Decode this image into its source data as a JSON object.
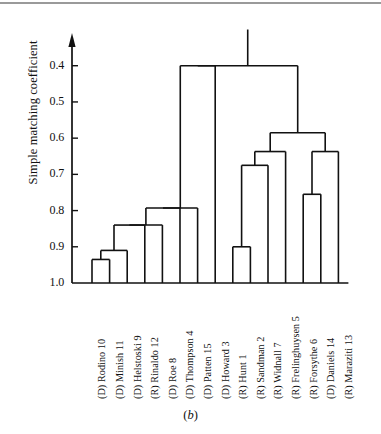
{
  "figure": {
    "caption_open": "(",
    "caption_letter": "b",
    "caption_close": ")",
    "axis_label": "Simple matching coefficient",
    "line_color": "#111111",
    "rule_color": "#9a9a9a"
  },
  "chart_data": {
    "type": "dendrogram",
    "title": "",
    "xlabel": "",
    "ylabel": "Simple matching coefficient",
    "ylim": [
      1.0,
      0.34
    ],
    "y_axis_inverted": true,
    "grid": false,
    "legend": null,
    "tick_labels": [
      "0.4",
      "0.5",
      "0.6",
      "0.7",
      "0.8",
      "0.9",
      "1.0"
    ],
    "tick_values": [
      0.4,
      0.5,
      0.6,
      0.7,
      0.8,
      0.9,
      1.0
    ],
    "leaves": [
      {
        "index": 0,
        "label": "(D) Rodino 10",
        "party": "D",
        "name": "Rodino",
        "number": 10
      },
      {
        "index": 1,
        "label": "(D) Minish 11",
        "party": "D",
        "name": "Minish",
        "number": 11
      },
      {
        "index": 2,
        "label": "(D) Helstoski 9",
        "party": "D",
        "name": "Helstoski",
        "number": 9
      },
      {
        "index": 3,
        "label": "(R) Rinaldo 12",
        "party": "R",
        "name": "Rinaldo",
        "number": 12
      },
      {
        "index": 4,
        "label": "(D) Roe 8",
        "party": "D",
        "name": "Roe",
        "number": 8
      },
      {
        "index": 5,
        "label": "(D) Thompson 4",
        "party": "D",
        "name": "Thompson",
        "number": 4
      },
      {
        "index": 6,
        "label": "(D) Patten 15",
        "party": "D",
        "name": "Patten",
        "number": 15
      },
      {
        "index": 7,
        "label": "(D) Howard 3",
        "party": "D",
        "name": "Howard",
        "number": 3
      },
      {
        "index": 8,
        "label": "(R) Hunt 1",
        "party": "R",
        "name": "Hunt",
        "number": 1
      },
      {
        "index": 9,
        "label": "(R) Sandman 2",
        "party": "R",
        "name": "Sandman",
        "number": 2
      },
      {
        "index": 10,
        "label": "(R) Widnall 7",
        "party": "R",
        "name": "Widnall",
        "number": 7
      },
      {
        "index": 11,
        "label": "(R) Frelinghuysen 5",
        "party": "R",
        "name": "Frelinghuysen",
        "number": 5
      },
      {
        "index": 12,
        "label": "(R) Forsythe 6",
        "party": "R",
        "name": "Forsythe",
        "number": 6
      },
      {
        "index": 13,
        "label": "(D) Daniels 14",
        "party": "D",
        "name": "Daniels",
        "number": 14
      },
      {
        "index": 14,
        "label": "(R) Maraziti 13",
        "party": "R",
        "name": "Maraziti",
        "number": 13
      }
    ],
    "merges": [
      {
        "id": "m1",
        "left": {
          "type": "leaf",
          "index": 0
        },
        "right": {
          "type": "leaf",
          "index": 1
        },
        "height": 0.935
      },
      {
        "id": "m2",
        "left": {
          "type": "node",
          "id": "m1"
        },
        "right": {
          "type": "leaf",
          "index": 2
        },
        "height": 0.91
      },
      {
        "id": "m3",
        "left": {
          "type": "node",
          "id": "m2"
        },
        "right": {
          "type": "leaf",
          "index": 3
        },
        "height": 0.84
      },
      {
        "id": "m4",
        "left": {
          "type": "node",
          "id": "m3"
        },
        "right": {
          "type": "leaf",
          "index": 4
        },
        "height": 0.84
      },
      {
        "id": "m5",
        "left": {
          "type": "node",
          "id": "m4"
        },
        "right": {
          "type": "leaf",
          "index": 5
        },
        "height": 0.793
      },
      {
        "id": "m6",
        "left": {
          "type": "node",
          "id": "m5"
        },
        "right": {
          "type": "leaf",
          "index": 6
        },
        "height": 0.793
      },
      {
        "id": "m7",
        "left": {
          "type": "node",
          "id": "m6"
        },
        "right": {
          "type": "leaf",
          "index": 7
        },
        "height": 0.4
      },
      {
        "id": "m8",
        "left": {
          "type": "leaf",
          "index": 8
        },
        "right": {
          "type": "leaf",
          "index": 9
        },
        "height": 0.9
      },
      {
        "id": "m9",
        "left": {
          "type": "node",
          "id": "m8"
        },
        "right": {
          "type": "leaf",
          "index": 10
        },
        "height": 0.675
      },
      {
        "id": "m10",
        "left": {
          "type": "node",
          "id": "m9"
        },
        "right": {
          "type": "leaf",
          "index": 11
        },
        "height": 0.637
      },
      {
        "id": "m11",
        "left": {
          "type": "leaf",
          "index": 12
        },
        "right": {
          "type": "leaf",
          "index": 13
        },
        "height": 0.755
      },
      {
        "id": "m12",
        "left": {
          "type": "node",
          "id": "m11"
        },
        "right": {
          "type": "leaf",
          "index": 14
        },
        "height": 0.637
      },
      {
        "id": "m13",
        "left": {
          "type": "node",
          "id": "m10"
        },
        "right": {
          "type": "node",
          "id": "m12"
        },
        "height": 0.585
      },
      {
        "id": "root",
        "left": {
          "type": "node",
          "id": "m7"
        },
        "right": {
          "type": "node",
          "id": "m13"
        },
        "height": 0.4
      }
    ],
    "root_stem_top": 0.3
  }
}
